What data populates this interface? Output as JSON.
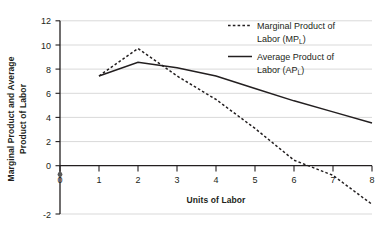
{
  "chart_data": {
    "type": "line",
    "title": "",
    "xlabel": "Units of Labor",
    "ylabel": "Marginal Product and Average Product of Labor",
    "xlim": [
      0,
      8
    ],
    "ylim": [
      -2,
      12
    ],
    "xticks": [
      "0",
      "1",
      "2",
      "3",
      "4",
      "5",
      "6",
      "7",
      "8"
    ],
    "yticks": [
      "-2",
      "0",
      "2",
      "4",
      "6",
      "8",
      "10",
      "12"
    ],
    "grid": "horizontal",
    "legend_position": "top-right",
    "x": [
      1,
      2,
      3,
      4,
      5,
      6,
      7,
      8
    ],
    "series": [
      {
        "name": "Marginal Product of Labor (MP_L)",
        "legend_line1": "Marginal Product of",
        "legend_line2_pre": "Labor (MP",
        "legend_line2_sub": "L",
        "legend_line2_post": ")",
        "style": "dashed",
        "color": "#231f20",
        "values": [
          8,
          10,
          8,
          6.3,
          4.2,
          1.9,
          0.8,
          -1.3
        ]
      },
      {
        "name": "Average Product of Labor (AP_L)",
        "legend_line1": "Average Product of",
        "legend_line2_pre": "Labor (AP",
        "legend_line2_sub": "L",
        "legend_line2_post": ")",
        "style": "solid",
        "color": "#231f20",
        "values": [
          8,
          9,
          8.6,
          8.0,
          7.1,
          6.2,
          5.4,
          4.6
        ]
      }
    ],
    "colors": {
      "axis": "#231f20",
      "grid": "#d9d9d9",
      "background": "#ffffff"
    }
  }
}
